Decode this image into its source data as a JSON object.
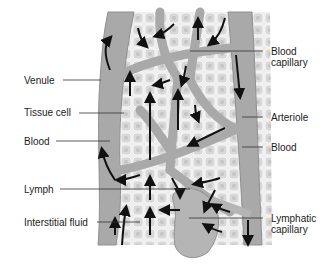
{
  "colors": {
    "background": "#ffffff",
    "vessel": "#a9a9a9",
    "vessel_dark": "#8f8f8f",
    "tissue": "#e6e6e6",
    "tissue_cell": "#cfcfcf",
    "arrow": "#111111",
    "leader_line": "#333333",
    "text": "#222222"
  },
  "labels": {
    "venule": "Venule",
    "tissue_cell": "Tissue cell",
    "blood_left": "Blood",
    "lymph": "Lymph",
    "interstitial_fluid": "Interstitial fluid",
    "blood_capillary_line1": "Blood",
    "blood_capillary_line2": "capillary",
    "arteriole": "Arteriole",
    "blood_right": "Blood",
    "lymphatic_capillary_line1": "Lymphatic",
    "lymphatic_capillary_line2": "capillary"
  }
}
